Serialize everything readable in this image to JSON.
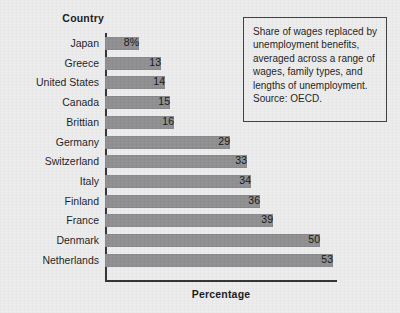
{
  "figure": {
    "category_header": "Country",
    "xlabel": "Percentage",
    "annotation": "Share of wages replaced by unemployment benefits, averaged across a range of wages, family types, and lengths of unemployment.\nSource: OECD.",
    "bar_color": "#8e8e90",
    "axis_color": "#2e2f33",
    "background_color": "#ececed",
    "box_border_color": "#3a3b40"
  },
  "chart_data": {
    "type": "bar",
    "orientation": "horizontal",
    "title": "",
    "subtitle": "",
    "xlabel": "Percentage",
    "ylabel": "Country",
    "xlim": [
      0,
      53
    ],
    "grid": false,
    "legend": false,
    "categories": [
      "Japan",
      "Greece",
      "United States",
      "Canada",
      "Brittian",
      "Germany",
      "Switzerland",
      "Italy",
      "Finland",
      "France",
      "Denmark",
      "Netherlands"
    ],
    "values": [
      8,
      13,
      14,
      15,
      16,
      29,
      33,
      34,
      36,
      39,
      50,
      53
    ],
    "value_labels": [
      "8%",
      "13",
      "14",
      "15",
      "16",
      "29",
      "33",
      "34",
      "36",
      "39",
      "50",
      "53"
    ],
    "annotations": [
      "Share of wages replaced by unemployment benefits, averaged across a range of wages, family types, and lengths of unemployment.",
      "Source: OECD."
    ]
  }
}
